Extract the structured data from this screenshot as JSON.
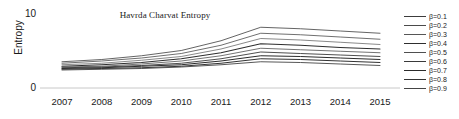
{
  "chart_data": {
    "type": "line",
    "title": "Havrda Charvat Entropy",
    "xlabel": "",
    "ylabel": "Entropy",
    "x": [
      2007,
      2008,
      2009,
      2010,
      2011,
      2012,
      2013,
      2014,
      2015
    ],
    "categories": [
      "2007",
      "2008",
      "2009",
      "2010",
      "2011",
      "2012",
      "2013",
      "2014",
      "2015"
    ],
    "xlim": [
      2007,
      2015
    ],
    "ylim": [
      0,
      10
    ],
    "yticks": [
      0,
      10
    ],
    "ytick_labels": [
      "0",
      "10"
    ],
    "grid": false,
    "baseline_only": true,
    "legend_position": "right-outside",
    "series": [
      {
        "name": "β=0.1",
        "color": "#3c3c3c",
        "width": 0.8,
        "values": [
          3.5,
          3.8,
          4.3,
          5.0,
          6.3,
          8.1,
          7.9,
          7.6,
          7.3
        ]
      },
      {
        "name": "β=0.2",
        "color": "#4a4a4a",
        "width": 0.8,
        "values": [
          3.3,
          3.6,
          4.0,
          4.6,
          5.7,
          7.3,
          7.1,
          6.8,
          6.5
        ]
      },
      {
        "name": "β=0.3",
        "color": "#565656",
        "width": 0.7,
        "values": [
          3.1,
          3.3,
          3.7,
          4.2,
          5.2,
          6.6,
          6.4,
          6.1,
          5.8
        ]
      },
      {
        "name": "β=0.4",
        "color": "#2e2e2e",
        "width": 1.1,
        "values": [
          2.9,
          3.1,
          3.4,
          3.9,
          4.7,
          5.9,
          5.7,
          5.4,
          5.2
        ]
      },
      {
        "name": "β=0.5",
        "color": "#4f4f4f",
        "width": 0.8,
        "values": [
          2.8,
          2.9,
          3.2,
          3.6,
          4.3,
          5.3,
          5.1,
          4.9,
          4.7
        ]
      },
      {
        "name": "β=0.6",
        "color": "#3a3a3a",
        "width": 0.9,
        "values": [
          2.7,
          2.8,
          3.0,
          3.3,
          3.9,
          4.8,
          4.6,
          4.4,
          4.2
        ]
      },
      {
        "name": "β=0.7",
        "color": "#2b2b2b",
        "width": 1.0,
        "values": [
          2.6,
          2.7,
          2.9,
          3.1,
          3.6,
          4.3,
          4.2,
          4.0,
          3.8
        ]
      },
      {
        "name": "β=0.8",
        "color": "#333333",
        "width": 1.0,
        "values": [
          2.5,
          2.6,
          2.7,
          2.9,
          3.3,
          3.9,
          3.8,
          3.6,
          3.4
        ]
      },
      {
        "name": "β=0.9",
        "color": "#444444",
        "width": 0.9,
        "values": [
          2.4,
          2.5,
          2.6,
          2.8,
          3.1,
          3.5,
          3.4,
          3.2,
          3.0
        ]
      }
    ]
  },
  "axes": {
    "ylabel": "Entropy",
    "ytick_top": "10",
    "ytick_bottom": "0",
    "baseline_color": "#c8c8c8"
  },
  "legend": {
    "entries": [
      {
        "label": "β=0.1"
      },
      {
        "label": "β=0.2"
      },
      {
        "label": "β=0.3"
      },
      {
        "label": "β=0.4"
      },
      {
        "label": "β=0.5"
      },
      {
        "label": "β=0.6"
      },
      {
        "label": "β=0.7"
      },
      {
        "label": "β=0.8"
      },
      {
        "label": "β=0.9"
      }
    ]
  }
}
